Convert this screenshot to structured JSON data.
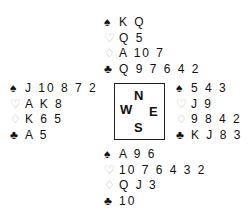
{
  "hands": {
    "north": {
      "spades": "K Q",
      "hearts": "Q 5",
      "diamonds": "A 10 7",
      "clubs": "Q 9 7 6 4 2"
    },
    "west": {
      "spades": "J 10 8 7 2",
      "hearts": "A K 8",
      "diamonds": "K 6 5",
      "clubs": "A 5"
    },
    "east": {
      "spades": "5 4 3",
      "hearts": "J 9",
      "diamonds": "9 8 4 2",
      "clubs": "K J 8 3"
    },
    "south": {
      "spades": "A 9 6",
      "hearts": "10 7 6 4 3 2",
      "diamonds": "Q J 3",
      "clubs": "10"
    }
  },
  "suits": {
    "spades": "♠",
    "hearts": "♡",
    "diamonds": "♢",
    "clubs": "♣"
  },
  "compass": {
    "n": "N",
    "w": "W",
    "e": "E",
    "s": "S"
  },
  "colors": {
    "black_suit": "#111111",
    "red_suit_outline": "#bbbbbb"
  }
}
